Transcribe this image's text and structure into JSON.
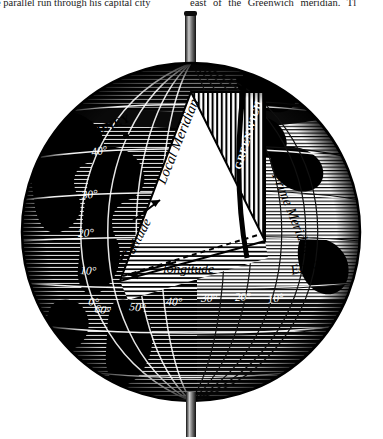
{
  "page": {
    "caption_left": "e parallel run through his capital city",
    "caption_right": "east of the Greenwich meridian. Tl"
  },
  "figure": {
    "name": "globe-coordinates-diagram",
    "style": "engraving",
    "labels": {
      "local_meridian": "Local Meridian",
      "prime_meridian": "Prime Meridian",
      "greenwich": "GREENWICH",
      "equator": "Equator",
      "sydney": "SYDNEY",
      "latitude": "latitude",
      "longitude": "longitude"
    },
    "latitude_ticks": [
      "40°",
      "30°",
      "20°",
      "10°",
      "0°"
    ],
    "longitude_ticks": [
      "60°",
      "50°",
      "40°",
      "30°",
      "20°",
      "10°"
    ],
    "colors": {
      "ink": "#000000",
      "paper": "#ffffff",
      "ocean_dark": "#121212",
      "ocean_mid": "#3a3a3a"
    }
  }
}
